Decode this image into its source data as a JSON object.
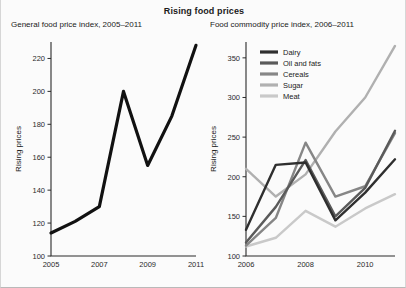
{
  "title": "Rising food prices",
  "panels": {
    "left": {
      "subtitle": "General food price index, 2005–2011",
      "ylabel": "Rising prices"
    },
    "right": {
      "subtitle": "Food commodity price index, 2006–2011",
      "ylabel": "Rising prices"
    }
  },
  "legend": {
    "items": [
      {
        "label": "Dairy",
        "color": "#2f2f2f"
      },
      {
        "label": "Oil and fats",
        "color": "#5a5a5a"
      },
      {
        "label": "Cereals",
        "color": "#868686"
      },
      {
        "label": "Sugar",
        "color": "#b0b0b0"
      },
      {
        "label": "Meat",
        "color": "#c9c9c9"
      }
    ]
  },
  "chart_data": [
    {
      "type": "line",
      "id": "general-food-price-index",
      "title": "General food price index, 2005–2011",
      "xlabel": "",
      "ylabel": "Rising prices",
      "xlim": [
        2005,
        2011
      ],
      "ylim": [
        100,
        230
      ],
      "grid": false,
      "legend_position": "none",
      "xticks": [
        2005,
        2007,
        2009,
        2011
      ],
      "xtick_labels": [
        "2005",
        "2007",
        "2009",
        "2011"
      ],
      "yticks": [
        100,
        120,
        140,
        160,
        180,
        200,
        220
      ],
      "ytick_labels": [
        "100",
        "120",
        "140",
        "160",
        "180",
        "200",
        "220"
      ],
      "x": [
        2005,
        2006,
        2007,
        2008,
        2009,
        2010,
        2011
      ],
      "series": [
        {
          "name": "General food price index",
          "color": "#111111",
          "values": [
            114,
            121,
            130,
            200,
            155,
            185,
            228
          ]
        }
      ]
    },
    {
      "type": "line",
      "id": "food-commodity-price-index",
      "title": "Food commodity price index, 2006–2011",
      "xlabel": "",
      "ylabel": "Rising prices",
      "xlim": [
        2006,
        2011
      ],
      "ylim": [
        100,
        370
      ],
      "grid": false,
      "legend_position": "top-left",
      "xticks": [
        2006,
        2008,
        2010
      ],
      "xtick_labels": [
        "2006",
        "2008",
        "2010"
      ],
      "yticks": [
        100,
        150,
        200,
        250,
        300,
        350
      ],
      "ytick_labels": [
        "100",
        "150",
        "200",
        "250",
        "300",
        "350"
      ],
      "x": [
        2006,
        2007,
        2008,
        2009,
        2010,
        2011
      ],
      "series": [
        {
          "name": "Dairy",
          "color": "#2f2f2f",
          "values": [
            133,
            215,
            218,
            145,
            180,
            222
          ]
        },
        {
          "name": "Oil and fats",
          "color": "#5a5a5a",
          "values": [
            117,
            162,
            221,
            150,
            186,
            258
          ]
        },
        {
          "name": "Cereals",
          "color": "#868686",
          "values": [
            113,
            148,
            243,
            175,
            188,
            255
          ]
        },
        {
          "name": "Sugar",
          "color": "#b0b0b0",
          "values": [
            210,
            175,
            203,
            257,
            300,
            365
          ]
        },
        {
          "name": "Meat",
          "color": "#c9c9c9",
          "values": [
            112,
            123,
            157,
            137,
            160,
            178
          ]
        }
      ]
    }
  ]
}
